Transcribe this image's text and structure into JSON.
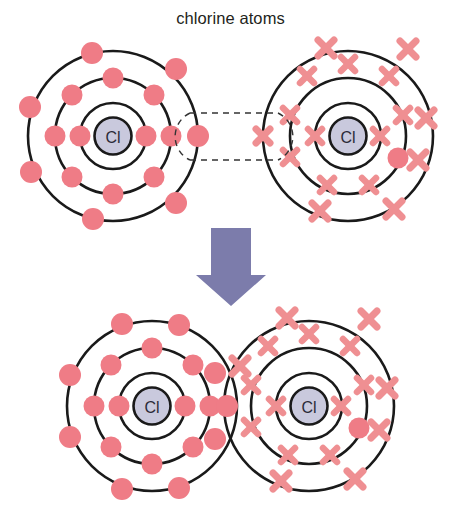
{
  "diagram": {
    "title": "chlorine atoms",
    "type": "dot-and-cross covalent bonding diagram",
    "nucleus_label": "Cl",
    "colors": {
      "electron_dot": "#ef7c86",
      "electron_cross": "#ef8f92",
      "shell_stroke": "#1a1a1a",
      "nucleus_fill": "#c9c9dd",
      "nucleus_stroke": "#1a1a1a",
      "arrow": "#7c7cab",
      "dashed_guide": "#333333",
      "title_text": "#231f20",
      "background": "#ffffff"
    },
    "arrow": {
      "name": "reaction-arrow",
      "direction": "down",
      "color": "#7c7cab",
      "x": 200,
      "y": 228,
      "width": 62,
      "height": 78
    },
    "top_row": {
      "label": "chlorine atoms",
      "atoms": [
        {
          "id": "top-left-atom",
          "marker": "dot",
          "nucleus_label": "Cl",
          "cx": 113,
          "cy": 136,
          "shells": [
            {
              "index": 1,
              "radius": 33,
              "electrons": 2,
              "angles": [
                0,
                180
              ]
            },
            {
              "index": 2,
              "radius": 58,
              "electrons": 8,
              "angles": [
                0,
                45,
                90,
                135,
                180,
                225,
                270,
                315
              ]
            },
            {
              "index": 3,
              "radius": 85,
              "electrons": 7,
              "angles": [
                0,
                52,
                104,
                156,
                204,
                256,
                308
              ]
            }
          ],
          "unpaired_electron_angle": 0
        },
        {
          "id": "top-right-atom",
          "marker": "cross",
          "nucleus_label": "Cl",
          "cx": 348,
          "cy": 136,
          "shells": [
            {
              "index": 1,
              "radius": 33,
              "electrons": 2,
              "angles": [
                0,
                180
              ]
            },
            {
              "index": 2,
              "radius": 58,
              "electrons": 8,
              "angles": [
                0,
                45,
                90,
                135,
                180,
                225,
                270,
                315
              ]
            },
            {
              "index": 3,
              "radius": 85,
              "electrons": 7,
              "angles": [
                0,
                52,
                104,
                156,
                204,
                256,
                308
              ]
            }
          ],
          "odd_dot": {
            "shell": 2,
            "angle": 20,
            "marker": "dot"
          },
          "unpaired_electron_angle": 180
        }
      ],
      "bond_guide": {
        "name": "bond-formation-guide",
        "style": "dashed",
        "left_x": 182,
        "right_x": 286,
        "top_y": 113,
        "bottom_y": 160
      }
    },
    "bottom_row": {
      "label": "chlorine molecule",
      "atoms": [
        {
          "id": "bottom-left-atom",
          "marker": "dot",
          "nucleus_label": "Cl",
          "cx": 152,
          "cy": 406,
          "shells": [
            {
              "index": 1,
              "radius": 33,
              "electrons": 2,
              "angles": [
                0,
                180
              ]
            },
            {
              "index": 2,
              "radius": 58,
              "electrons": 8,
              "angles": [
                0,
                45,
                90,
                135,
                180,
                225,
                270,
                315
              ]
            },
            {
              "index": 3,
              "radius": 85,
              "electrons": 7,
              "angles": [
                0,
                52,
                104,
                156,
                204,
                256,
                308
              ]
            }
          ]
        },
        {
          "id": "bottom-right-atom",
          "marker": "cross",
          "nucleus_label": "Cl",
          "cx": 309,
          "cy": 406,
          "shells": [
            {
              "index": 1,
              "radius": 33,
              "electrons": 2,
              "angles": [
                0,
                180
              ]
            },
            {
              "index": 2,
              "radius": 58,
              "electrons": 8,
              "angles": [
                0,
                45,
                90,
                135,
                180,
                225,
                270,
                315
              ]
            },
            {
              "index": 3,
              "radius": 85,
              "electrons": 7,
              "angles": [
                0,
                52,
                104,
                156,
                204,
                256,
                308
              ]
            }
          ],
          "odd_dot": {
            "shell": 2,
            "angle": 20,
            "marker": "dot"
          }
        }
      ],
      "shared_pair": {
        "name": "shared-electron-pair",
        "x": 231,
        "y": 406,
        "dot_offset_x": -6,
        "cross_offset_x": 9,
        "description": "one dot and one cross shared in overlap region"
      }
    }
  }
}
